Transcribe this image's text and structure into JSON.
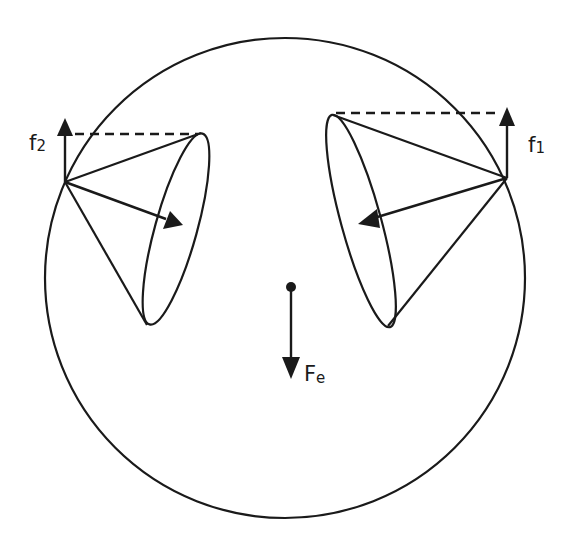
{
  "diagram": {
    "colors": {
      "stroke": "#1a1a1a",
      "background": "#ffffff"
    },
    "labels": {
      "f1": {
        "base": "f",
        "sub": "1"
      },
      "f2": {
        "base": "f",
        "sub": "2"
      },
      "fe": {
        "base": "F",
        "sub": "e"
      }
    },
    "elements": {
      "outer_circle": {
        "cx": 285,
        "cy": 278,
        "r": 240
      },
      "left_cone": {
        "apex": [
          65,
          182
        ],
        "ellipse_center": [
          176,
          229
        ],
        "ellipse_rx": 99,
        "ellipse_ry": 22,
        "ellipse_rotation_deg": 105.5,
        "axis_arrow_tip": [
          183,
          225
        ],
        "vertical_arrow": "f2",
        "dashed_line_y": 133
      },
      "right_cone": {
        "apex": [
          507,
          178
        ],
        "ellipse_center": [
          361,
          221
        ],
        "ellipse_rx": 110,
        "ellipse_ry": 21,
        "ellipse_rotation_deg": 74.7,
        "axis_arrow_tip": [
          358,
          224
        ],
        "vertical_arrow": "f1",
        "dashed_line_y": 112
      },
      "center_force": {
        "origin": [
          291,
          287
        ],
        "tip": [
          291,
          379
        ],
        "label": "Fe"
      }
    }
  }
}
